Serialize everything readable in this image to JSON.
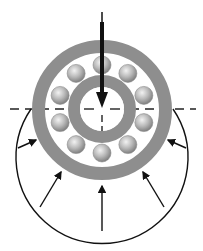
{
  "figure": {
    "caption": "",
    "colors": {
      "ring": "#8c8c8c",
      "ball": "#b4b4b4",
      "line": "#111111",
      "centerline": "#222222"
    },
    "geometry": {
      "center": [
        102,
        109
      ],
      "outer_ring": {
        "r_outer": 70,
        "r_inner": 57
      },
      "inner_ring": {
        "r_outer": 34,
        "r_inner": 22
      },
      "balls": {
        "count": 10,
        "pitch_radius": 44,
        "ball_radius": 9
      },
      "load_arc": {
        "cx": 102,
        "cy": 146,
        "r": 86
      }
    },
    "labels": {
      "applied_load": "radial-load-arrow",
      "reaction_forces": "load-distribution-arrows"
    }
  }
}
